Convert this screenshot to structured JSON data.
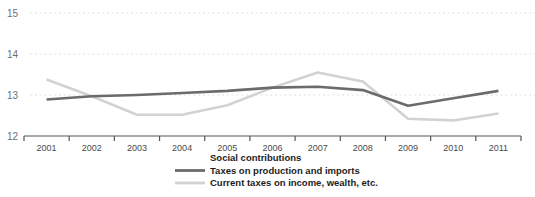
{
  "chart_data": {
    "type": "line",
    "title": "",
    "subtitle": "",
    "xlabel": "",
    "ylabel": "",
    "categories": [
      "2001",
      "2002",
      "2003",
      "2004",
      "2005",
      "2006",
      "2007",
      "2008",
      "2009",
      "2010",
      "2011"
    ],
    "x": [
      2001,
      2002,
      2003,
      2004,
      2005,
      2006,
      2007,
      2008,
      2009,
      2010,
      2011
    ],
    "ylim": [
      12,
      15
    ],
    "yticks": [
      12,
      13,
      14,
      15
    ],
    "ytick_labels": [
      "12",
      "13",
      "14",
      "15"
    ],
    "grid": true,
    "grid_axis": "y",
    "legend_position": "bottom",
    "series": [
      {
        "name": "Taxes on production and imports",
        "color": "#6b6b6b",
        "width": 2.6,
        "values": [
          12.89,
          12.97,
          13.0,
          13.05,
          13.1,
          13.18,
          13.2,
          13.12,
          12.74,
          12.92,
          13.1
        ]
      },
      {
        "name": "Current taxes on income, wealth, etc.",
        "color": "#d2d2d2",
        "width": 2.6,
        "values": [
          13.38,
          12.97,
          12.52,
          12.52,
          12.75,
          13.18,
          13.55,
          13.33,
          12.42,
          12.38,
          12.55
        ]
      }
    ]
  },
  "legend": {
    "entries": [
      {
        "label": "Social contributions",
        "has_swatch": false,
        "color": "#1d1d1d"
      },
      {
        "label": "Taxes on production and imports",
        "has_swatch": true,
        "color": "#6b6b6b"
      },
      {
        "label": "Current taxes on income, wealth, etc.",
        "has_swatch": true,
        "color": "#d2d2d2"
      }
    ]
  },
  "axis": {
    "y_labels": [
      "15",
      "14",
      "13",
      "12"
    ],
    "x_labels": [
      "2001",
      "2002",
      "2003",
      "2004",
      "2005",
      "2006",
      "2007",
      "2008",
      "2009",
      "2010",
      "2011"
    ]
  },
  "colors": {
    "grid": "#e2e2e2",
    "axis": "#555555",
    "series_dark": "#6b6b6b",
    "series_light": "#d2d2d2",
    "text": "#1d1d1d",
    "tick_text": "#6f6f6f",
    "background": "#ffffff"
  }
}
